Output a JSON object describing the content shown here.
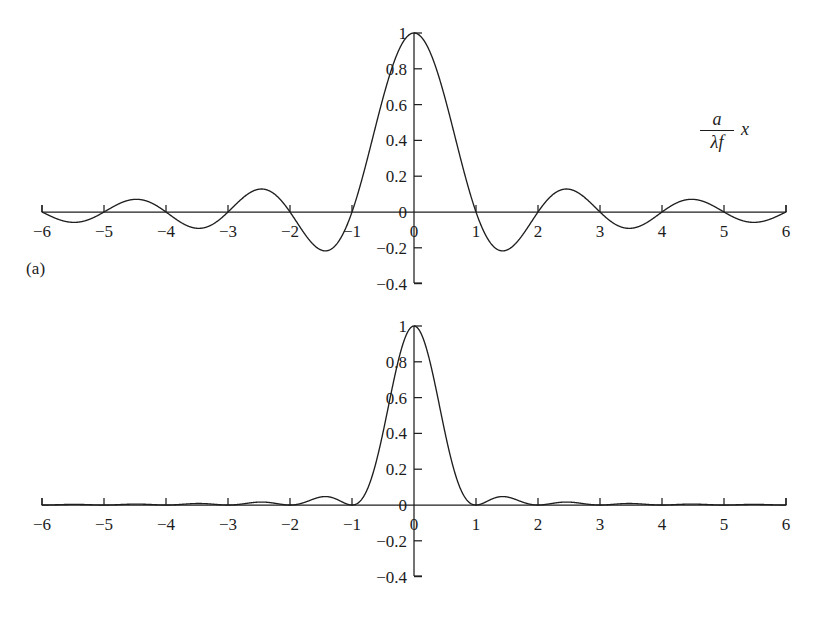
{
  "figure": {
    "panels": [
      {
        "id": "a",
        "caption": "(a)",
        "axis_label": {
          "numerator": "a",
          "denominator": "λf",
          "variable": "x"
        }
      },
      {
        "id": "b",
        "caption": "(b)",
        "axis_label": {
          "numerator": "a",
          "denominator": "λf",
          "variable": "x"
        }
      }
    ]
  },
  "chart_data": [
    {
      "type": "line",
      "panel": "a",
      "title": "",
      "subtitle": "",
      "function": "sinc(x) = sin(pi*x)/(pi*x)",
      "xlabel": "(a/λf) x",
      "ylabel": "",
      "xlim": [
        -6,
        6
      ],
      "ylim": [
        -0.4,
        1.0
      ],
      "grid": false,
      "legend": "none",
      "xticks": [
        -6,
        -5,
        -4,
        -3,
        -2,
        -1,
        0,
        1,
        2,
        3,
        4,
        5,
        6
      ],
      "xticklabels": [
        "-6",
        "-5",
        "-4",
        "-3",
        "-2",
        "-1",
        "0",
        "1",
        "2",
        "3",
        "4",
        "5",
        "6"
      ],
      "yticks": [
        -0.4,
        -0.2,
        0,
        0.2,
        0.4,
        0.6,
        0.8,
        1
      ],
      "yticklabels": [
        "-0.4",
        "-0.2",
        "0",
        "0.2",
        "0.4",
        "0.6",
        "0.8",
        "1"
      ],
      "series": [
        {
          "name": "sinc",
          "x": [
            -6.0,
            -5.75,
            -5.5,
            -5.25,
            -5.0,
            -4.75,
            -4.5,
            -4.25,
            -4.0,
            -3.75,
            -3.5,
            -3.25,
            -3.0,
            -2.75,
            -2.5,
            -2.25,
            -2.0,
            -1.75,
            -1.5,
            -1.25,
            -1.0,
            -0.75,
            -0.5,
            -0.25,
            0.0,
            0.25,
            0.5,
            0.75,
            1.0,
            1.25,
            1.5,
            1.75,
            2.0,
            2.25,
            2.5,
            2.75,
            3.0,
            3.25,
            3.5,
            3.75,
            4.0,
            4.25,
            4.5,
            4.75,
            5.0,
            5.25,
            5.5,
            5.75,
            6.0
          ],
          "y": [
            0.0,
            0.0392,
            0.0546,
            0.0386,
            0.0,
            -0.0433,
            -0.0707,
            -0.0596,
            0.0,
            0.0601,
            0.0909,
            0.0697,
            0.0,
            -0.0819,
            -0.1273,
            -0.1006,
            0.0,
            0.1286,
            0.2122,
            0.1801,
            0.0,
            -0.3001,
            -0.6366,
            -0.9003,
            1.0,
            0.9003,
            0.6366,
            0.3001,
            0.0,
            -0.1801,
            -0.2122,
            -0.1286,
            0.0,
            0.1006,
            0.1273,
            0.0819,
            0.0,
            -0.0697,
            -0.0909,
            -0.0601,
            0.0,
            0.0596,
            0.0707,
            0.0433,
            0.0,
            -0.0386,
            -0.0546,
            -0.0392,
            0.0
          ]
        }
      ],
      "annotations": [
        {
          "text": "(a)",
          "role": "panel-caption"
        },
        {
          "text": "(a/λf) x",
          "role": "x-axis-label"
        }
      ],
      "key_points": {
        "main_peak": {
          "x": 0,
          "y": 1
        },
        "zeros": [
          -6,
          -5,
          -4,
          -3,
          -2,
          -1,
          1,
          2,
          3,
          4,
          5,
          6
        ],
        "first_minima": [
          {
            "x": -1.43,
            "y": -0.217
          },
          {
            "x": 1.43,
            "y": -0.217
          }
        ],
        "first_sidelobes": [
          {
            "x": -2.46,
            "y": 0.128
          },
          {
            "x": 2.46,
            "y": 0.128
          }
        ]
      }
    },
    {
      "type": "line",
      "panel": "b",
      "title": "",
      "subtitle": "",
      "function": "sinc^2(x) = (sin(pi*x)/(pi*x))^2",
      "xlabel": "(a/λf) x",
      "ylabel": "",
      "xlim": [
        -6,
        6
      ],
      "ylim": [
        -0.4,
        1.0
      ],
      "grid": false,
      "legend": "none",
      "xticks": [
        -6,
        -5,
        -4,
        -3,
        -2,
        -1,
        0,
        1,
        2,
        3,
        4,
        5,
        6
      ],
      "xticklabels": [
        "-6",
        "-5",
        "-4",
        "-3",
        "-2",
        "-1",
        "0",
        "1",
        "2",
        "3",
        "4",
        "5",
        "6"
      ],
      "yticks": [
        -0.4,
        -0.2,
        0,
        0.2,
        0.4,
        0.6,
        0.8,
        1
      ],
      "yticklabels": [
        "-0.4",
        "-0.2",
        "0",
        "0.2",
        "0.4",
        "0.6",
        "0.8",
        "1"
      ],
      "series": [
        {
          "name": "sinc-squared",
          "x": [
            -6.0,
            -5.5,
            -5.0,
            -4.5,
            -4.0,
            -3.5,
            -3.0,
            -2.5,
            -2.0,
            -1.5,
            -1.0,
            -0.75,
            -0.5,
            -0.25,
            0.0,
            0.25,
            0.5,
            0.75,
            1.0,
            1.5,
            2.0,
            2.5,
            3.0,
            3.5,
            4.0,
            4.5,
            5.0,
            5.5,
            6.0
          ],
          "y": [
            0.0,
            0.003,
            0.0,
            0.005,
            0.0,
            0.0083,
            0.0,
            0.0162,
            0.0,
            0.045,
            0.0,
            0.0901,
            0.4053,
            0.8106,
            1.0,
            0.8106,
            0.4053,
            0.0901,
            0.0,
            0.045,
            0.0,
            0.0162,
            0.0,
            0.0083,
            0.0,
            0.005,
            0.0,
            0.003,
            0.0
          ]
        }
      ],
      "annotations": [
        {
          "text": "(b)",
          "role": "panel-caption"
        },
        {
          "text": "(a/λf) x",
          "role": "x-axis-label"
        }
      ],
      "key_points": {
        "main_peak": {
          "x": 0,
          "y": 1
        },
        "zeros": [
          -6,
          -5,
          -4,
          -3,
          -2,
          -1,
          1,
          2,
          3,
          4,
          5,
          6
        ],
        "first_sidelobes": [
          {
            "x": -1.43,
            "y": 0.0472
          },
          {
            "x": 1.43,
            "y": 0.0472
          }
        ]
      }
    }
  ],
  "style": {
    "curve_color": "#1f1f1f",
    "axis_color": "#1f1f1f",
    "text_color": "#1c1c1c",
    "background": "#ffffff"
  }
}
